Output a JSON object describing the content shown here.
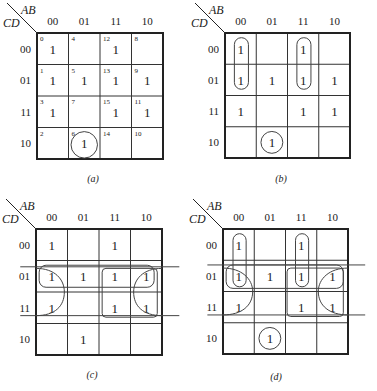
{
  "figure": {
    "row_var": "CD",
    "col_var": "AB",
    "col_labels": [
      "00",
      "01",
      "11",
      "10"
    ],
    "row_labels": [
      "00",
      "01",
      "11",
      "10"
    ],
    "colors": {
      "line": "#222222",
      "grid": "#333333",
      "loop": "#444444"
    }
  },
  "maps": [
    {
      "id": "a",
      "caption": "(a)",
      "origin": [
        37,
        33
      ],
      "size": 126,
      "caption_pos": [
        93,
        182
      ],
      "minterm_numbers": [
        [
          "0",
          "4",
          "12",
          "8"
        ],
        [
          "1",
          "5",
          "13",
          "9"
        ],
        [
          "3",
          "7",
          "15",
          "11"
        ],
        [
          "2",
          "6",
          "14",
          "10"
        ]
      ],
      "cells": [
        [
          "1",
          "",
          "1",
          ""
        ],
        [
          "1",
          "1",
          "1",
          "1"
        ],
        [
          "1",
          "",
          "1",
          "1"
        ],
        [
          "",
          "1",
          "",
          ""
        ]
      ],
      "loops": [
        {
          "type": "circle",
          "cx": 1.5,
          "cy": 3.55,
          "r": 0.42
        }
      ]
    },
    {
      "id": "b",
      "caption": "(b)",
      "origin": [
        225,
        33
      ],
      "size": 125,
      "caption_pos": [
        281,
        182
      ],
      "minterm_numbers": null,
      "cells": [
        [
          "1",
          "",
          "1",
          ""
        ],
        [
          "1",
          "1",
          "1",
          "1"
        ],
        [
          "1",
          "",
          "1",
          "1"
        ],
        [
          "",
          "1",
          "",
          ""
        ]
      ],
      "loops": [
        {
          "type": "rect",
          "x": 0.3,
          "y": 0.15,
          "w": 0.45,
          "h": 1.65,
          "rx": 0.22
        },
        {
          "type": "rect",
          "x": 2.3,
          "y": 0.15,
          "w": 0.45,
          "h": 1.65,
          "rx": 0.22
        },
        {
          "type": "circle",
          "cx": 1.5,
          "cy": 3.5,
          "r": 0.35
        }
      ]
    },
    {
      "id": "c",
      "caption": "(c)",
      "origin": [
        36,
        229
      ],
      "size": 126,
      "caption_pos": [
        92,
        378
      ],
      "minterm_numbers": null,
      "cells": [
        [
          "1",
          "",
          "1",
          ""
        ],
        [
          "1",
          "1",
          "1",
          ""
        ],
        [
          "1",
          "",
          "1",
          "1"
        ],
        [
          "",
          "1",
          "",
          ""
        ]
      ],
      "cells_override": [
        [
          "1",
          "",
          "1",
          ""
        ],
        [
          "1",
          "1",
          "1",
          "1"
        ],
        [
          "1",
          "",
          "1",
          "1"
        ],
        [
          "",
          "1",
          "",
          ""
        ]
      ],
      "loops": [
        {
          "type": "hline",
          "x1": -0.5,
          "x2": 4.55,
          "y": 1.2
        },
        {
          "type": "hline",
          "x1": -0.5,
          "x2": 4.55,
          "y": 2.75
        },
        {
          "type": "rect",
          "x": 0.1,
          "y": 1.15,
          "w": 3.65,
          "h": 0.7,
          "rx": 0.22
        },
        {
          "type": "path",
          "d": "M0,1.25 C0.6,1.25 0.9,1.6 0.9,2.0 C0.9,2.45 0.6,2.75 0,2.75"
        },
        {
          "type": "rect",
          "x": 2.1,
          "y": 1.25,
          "w": 1.75,
          "h": 1.55,
          "rx": 0.12
        },
        {
          "type": "path",
          "d": "M4,1.25 C3.4,1.25 3.1,1.6 3.1,2.0 C3.1,2.45 3.4,2.75 4,2.75"
        }
      ]
    },
    {
      "id": "d",
      "caption": "(d)",
      "origin": [
        223,
        229
      ],
      "size": 125,
      "caption_pos": [
        276,
        380
      ],
      "minterm_numbers": null,
      "cells": [
        [
          "1",
          "",
          "1",
          ""
        ],
        [
          "1",
          "1",
          "1",
          "1"
        ],
        [
          "1",
          "",
          "1",
          "1"
        ],
        [
          "",
          "1",
          "",
          ""
        ]
      ],
      "loops": [
        {
          "type": "hline",
          "x1": -0.5,
          "x2": 4.55,
          "y": 1.15
        },
        {
          "type": "hline",
          "x1": -0.5,
          "x2": 4.55,
          "y": 2.75
        },
        {
          "type": "rect",
          "x": 0.32,
          "y": 0.15,
          "w": 0.42,
          "h": 1.7,
          "rx": 0.21
        },
        {
          "type": "rect",
          "x": 2.32,
          "y": 0.15,
          "w": 0.42,
          "h": 1.7,
          "rx": 0.21
        },
        {
          "type": "rect",
          "x": 0.1,
          "y": 1.15,
          "w": 3.75,
          "h": 0.75,
          "rx": 0.22
        },
        {
          "type": "path",
          "d": "M0,1.25 C0.6,1.25 0.95,1.6 0.95,2.0 C0.95,2.45 0.6,2.75 0,2.75"
        },
        {
          "type": "rect",
          "x": 2.05,
          "y": 1.25,
          "w": 1.8,
          "h": 1.55,
          "rx": 0.12
        },
        {
          "type": "path",
          "d": "M4,1.25 C3.4,1.25 3.05,1.6 3.05,2.0 C3.05,2.45 3.4,2.75 4,2.75"
        },
        {
          "type": "circle",
          "cx": 1.5,
          "cy": 3.5,
          "r": 0.35
        }
      ]
    }
  ]
}
